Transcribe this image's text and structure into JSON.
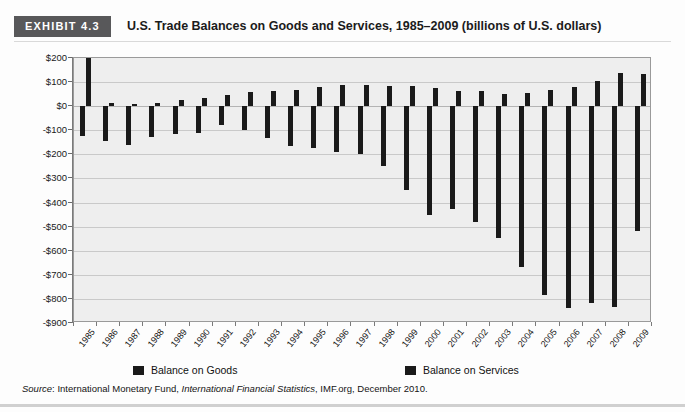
{
  "header": {
    "exhibit_tag": "EXHIBIT 4.3",
    "title": "U.S. Trade Balances on Goods and Services, 1985–2009 (billions of U.S. dollars)"
  },
  "legend": {
    "items": [
      {
        "label": "Balance on Goods",
        "color": "#1a1a1a"
      },
      {
        "label": "Balance on Services",
        "color": "#1a1a1a"
      }
    ]
  },
  "source": {
    "prefix": "Source",
    "colon": ": ",
    "part1": "International Monetary Fund, ",
    "italic": "International Financial Statistics",
    "part2": ", IMF.org, December 2010."
  },
  "chart_data": {
    "type": "bar",
    "title": "U.S. Trade Balances on Goods and Services, 1985–2009 (billions of U.S. dollars)",
    "xlabel": "",
    "ylabel": "",
    "ylim": [
      -900,
      200
    ],
    "ytick_values": [
      200,
      100,
      0,
      -100,
      -200,
      -300,
      -400,
      -500,
      -600,
      -700,
      -800,
      -900
    ],
    "ytick_labels": [
      "$200",
      "$100",
      "$0",
      "-$100",
      "-$200",
      "-$300",
      "-$400",
      "-$500",
      "-$600",
      "-$700",
      "-$800",
      "-$900"
    ],
    "grid": true,
    "legend_position": "bottom",
    "categories": [
      "1985",
      "1986",
      "1987",
      "1988",
      "1989",
      "1990",
      "1991",
      "1992",
      "1993",
      "1994",
      "1995",
      "1996",
      "1997",
      "1998",
      "1999",
      "2000",
      "2001",
      "2002",
      "2003",
      "2004",
      "2005",
      "2006",
      "2007",
      "2008",
      "2009"
    ],
    "series": [
      {
        "name": "Balance on Goods",
        "values": [
          -122,
          -145,
          -160,
          -127,
          -116,
          -111,
          -77,
          -97,
          -133,
          -166,
          -174,
          -191,
          -198,
          -247,
          -346,
          -452,
          -427,
          -482,
          -547,
          -666,
          -783,
          -838,
          -819,
          -835,
          -517
        ]
      },
      {
        "name": "Balance on Services",
        "values": [
          295,
          12,
          8,
          13,
          26,
          32,
          46,
          60,
          62,
          67,
          78,
          87,
          90,
          82,
          82,
          74,
          64,
          61,
          52,
          54,
          66,
          79,
          104,
          136,
          132
        ]
      }
    ]
  }
}
